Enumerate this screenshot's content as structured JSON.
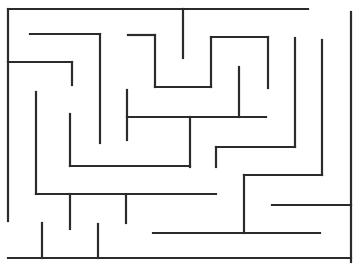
{
  "maze": {
    "width": 353,
    "height": 268,
    "background": "#ffffff",
    "wall_color": "#2b2b2b",
    "walls": [
      [
        8,
        9,
        308,
        9
      ],
      [
        8,
        9,
        8,
        221
      ],
      [
        351,
        12,
        351,
        262
      ],
      [
        8,
        258,
        351,
        258
      ],
      [
        30,
        34,
        100,
        34
      ],
      [
        100,
        34,
        100,
        143
      ],
      [
        8,
        62,
        72,
        62
      ],
      [
        72,
        62,
        72,
        85
      ],
      [
        36,
        92,
        36,
        194
      ],
      [
        128,
        35,
        155,
        35
      ],
      [
        155,
        35,
        155,
        87
      ],
      [
        155,
        87,
        211,
        87
      ],
      [
        183,
        9,
        183,
        58
      ],
      [
        211,
        37,
        268,
        37
      ],
      [
        211,
        37,
        211,
        87
      ],
      [
        268,
        37,
        268,
        88
      ],
      [
        239,
        67,
        239,
        117
      ],
      [
        127,
        90,
        127,
        140
      ],
      [
        127,
        117,
        266,
        117
      ],
      [
        190,
        117,
        190,
        167
      ],
      [
        70,
        114,
        70,
        166
      ],
      [
        70,
        166,
        190,
        166
      ],
      [
        295,
        38,
        295,
        147
      ],
      [
        216,
        147,
        295,
        147
      ],
      [
        216,
        147,
        216,
        167
      ],
      [
        322,
        40,
        322,
        175
      ],
      [
        244,
        175,
        322,
        175
      ],
      [
        244,
        175,
        244,
        233
      ],
      [
        36,
        194,
        216,
        194
      ],
      [
        70,
        194,
        70,
        229
      ],
      [
        126,
        195,
        126,
        223
      ],
      [
        272,
        205,
        351,
        205
      ],
      [
        153,
        233,
        320,
        233
      ],
      [
        42,
        223,
        42,
        258
      ],
      [
        98,
        224,
        98,
        258
      ]
    ]
  }
}
